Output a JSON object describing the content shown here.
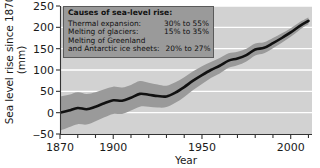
{
  "chart_data": {
    "type": "line",
    "title": "",
    "xlabel": "Year",
    "ylabel_line1": "Sea level rise since 1870",
    "ylabel_line2": "(mm)",
    "xlim": [
      1870,
      2012
    ],
    "ylim": [
      -50,
      250
    ],
    "xticks_major": [
      1870,
      1900,
      1950,
      2000
    ],
    "xticks_minor_step": 10,
    "yticks": [
      -50,
      0,
      50,
      100,
      150,
      200,
      250
    ],
    "grid": "horizontal white gridlines",
    "legend_position": "top-left inside plot",
    "series": [
      {
        "name": "Sea level rise since 1870",
        "style": "thick black line with gray uncertainty band",
        "x": [
          1870,
          1875,
          1880,
          1885,
          1890,
          1895,
          1900,
          1905,
          1910,
          1915,
          1920,
          1925,
          1930,
          1935,
          1940,
          1945,
          1950,
          1955,
          1960,
          1965,
          1970,
          1975,
          1980,
          1985,
          1990,
          1995,
          2000,
          2005,
          2010
        ],
        "values": [
          0,
          5,
          11,
          8,
          14,
          22,
          29,
          28,
          35,
          44,
          42,
          39,
          38,
          47,
          60,
          75,
          88,
          100,
          110,
          122,
          127,
          135,
          148,
          152,
          163,
          175,
          188,
          203,
          215
        ],
        "band_lower": [
          -42,
          -34,
          -27,
          -28,
          -20,
          -11,
          -3,
          -3,
          5,
          14,
          14,
          12,
          13,
          23,
          37,
          53,
          67,
          81,
          92,
          105,
          111,
          120,
          134,
          139,
          151,
          164,
          178,
          194,
          207
        ],
        "band_upper": [
          38,
          42,
          48,
          44,
          48,
          55,
          61,
          59,
          65,
          74,
          70,
          66,
          63,
          71,
          83,
          97,
          109,
          119,
          128,
          139,
          143,
          150,
          162,
          165,
          175,
          186,
          198,
          212,
          223
        ]
      }
    ]
  },
  "legend": {
    "title": "Causes of sea-level rise:",
    "rows": [
      {
        "name": "Thermal expansion:",
        "value": "30% to 55%"
      },
      {
        "name": "Melting of glaciers:",
        "value": "15% to 35%"
      },
      {
        "name": "Melting of Greenland",
        "value": ""
      },
      {
        "name": "and Antarctic ice sheets:",
        "value": "20% to 27%"
      }
    ]
  },
  "colors": {
    "plot_background": "#d2d2d2",
    "gridline": "#ffffff",
    "band": "#9a9a9a",
    "line": "#111111",
    "legend_background": "#9a9a9a",
    "legend_border": "#5a5a5a",
    "axis": "#333333",
    "text": "#1a1a1a"
  },
  "ytick_labels": [
    "250",
    "200",
    "150",
    "100",
    "50",
    "0",
    "‒50"
  ],
  "xtick_labels": [
    "1870",
    "1900",
    "1950",
    "2000"
  ]
}
